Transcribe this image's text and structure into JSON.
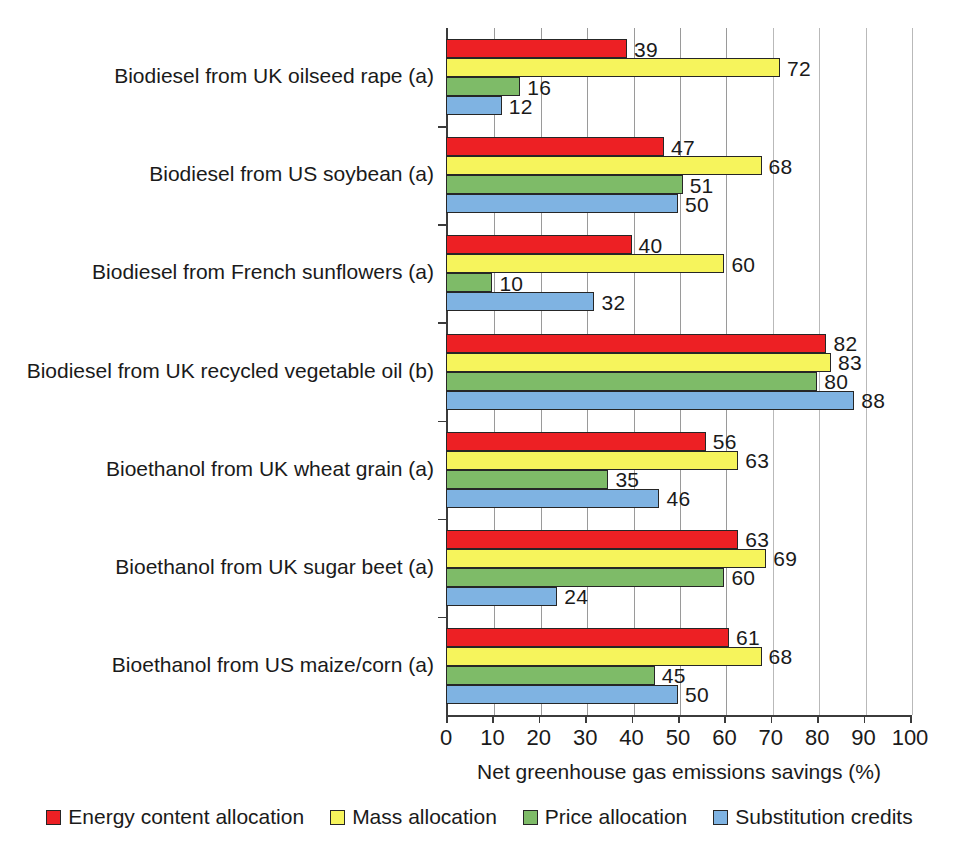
{
  "chart_data": {
    "type": "bar",
    "orientation": "horizontal",
    "title": "",
    "xlabel": "Net greenhouse gas emissions savings (%)",
    "ylabel": "",
    "xlim": [
      0,
      100
    ],
    "xticks": [
      0,
      10,
      20,
      30,
      40,
      50,
      60,
      70,
      80,
      90,
      100
    ],
    "grid": true,
    "legend_position": "bottom",
    "categories": [
      "Biodiesel from UK oilseed rape (a)",
      "Biodiesel from US soybean (a)",
      "Biodiesel from French sunflowers (a)",
      "Biodiesel from UK recycled vegetable oil (b)",
      "Bioethanol from UK wheat grain (a)",
      "Bioethanol from UK sugar beet (a)",
      "Bioethanol from US maize/corn (a)"
    ],
    "series": [
      {
        "name": "Energy content allocation",
        "color": "#ED2024",
        "values": [
          39,
          47,
          40,
          82,
          56,
          63,
          61
        ]
      },
      {
        "name": "Mass allocation",
        "color": "#F6F45C",
        "values": [
          72,
          68,
          60,
          83,
          63,
          69,
          68
        ]
      },
      {
        "name": "Price allocation",
        "color": "#7EBB68",
        "values": [
          16,
          51,
          10,
          80,
          35,
          60,
          45
        ]
      },
      {
        "name": "Substitution credits",
        "color": "#7FB3E2",
        "values": [
          12,
          50,
          32,
          88,
          46,
          24,
          50
        ]
      }
    ]
  },
  "legend": {
    "items": [
      {
        "label": "Energy content allocation",
        "color": "#ED2024"
      },
      {
        "label": "Mass allocation",
        "color": "#F6F45C"
      },
      {
        "label": "Price allocation",
        "color": "#7EBB68"
      },
      {
        "label": "Substitution credits",
        "color": "#7FB3E2"
      }
    ]
  }
}
